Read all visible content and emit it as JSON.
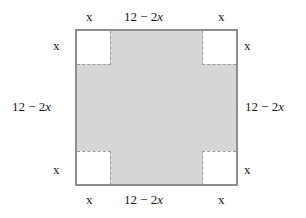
{
  "figure": {
    "colors": {
      "shaded_fill": "#d6d6d6",
      "outer_border": "#8e8e8e",
      "fold_line": "#9a9a9a",
      "cutout_fill": "#ffffff",
      "text": "#1a1a1a",
      "background": "#ffffff"
    },
    "labels": {
      "corner_x": "x",
      "side_expression": "12 − 2x",
      "top": {
        "left": "x",
        "middle": "12 − 2x",
        "right": "x"
      },
      "bottom": {
        "left": "x",
        "middle": "12 − 2x",
        "right": "x"
      },
      "left": {
        "top": "x",
        "middle": "12 − 2x",
        "bottom": "x"
      },
      "right": {
        "top": "x",
        "middle": "12 − 2x",
        "bottom": "x"
      }
    }
  }
}
